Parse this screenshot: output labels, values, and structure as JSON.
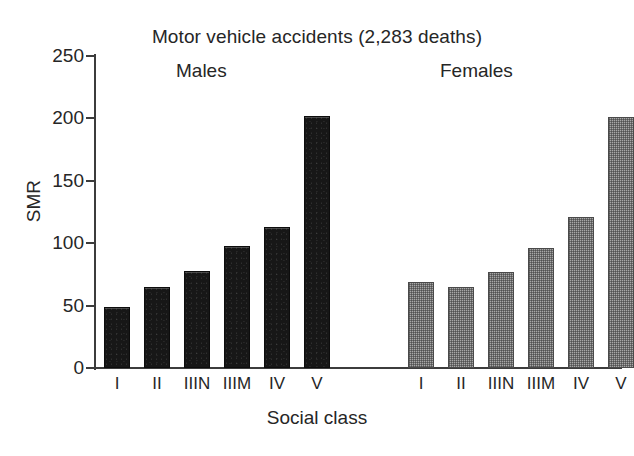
{
  "chart_data": {
    "type": "bar",
    "title": "Motor vehicle accidents (2,283 deaths)",
    "xlabel": "Social class",
    "ylabel": "SMR",
    "ylim": [
      0,
      250
    ],
    "yticks": [
      0,
      50,
      100,
      150,
      200,
      250
    ],
    "ytick_labels": [
      "0",
      "50",
      "100",
      "150",
      "200",
      "250"
    ],
    "grid": false,
    "legend": "none",
    "group_labels": [
      "Males",
      "Females"
    ],
    "categories": [
      "I",
      "II",
      "IIIN",
      "IIIM",
      "IV",
      "V"
    ],
    "series": [
      {
        "name": "Males",
        "color": "#171717",
        "values": [
          49,
          65,
          78,
          98,
          113,
          202
        ]
      },
      {
        "name": "Females",
        "color": "#a8a8a8",
        "values": [
          69,
          65,
          77,
          96,
          121,
          201
        ]
      }
    ]
  },
  "colors": {
    "male_bar": "#171717",
    "female_bar": "#a8a8a8",
    "axis": "#3c3c3c",
    "text": "#262626",
    "background": "#ffffff"
  }
}
